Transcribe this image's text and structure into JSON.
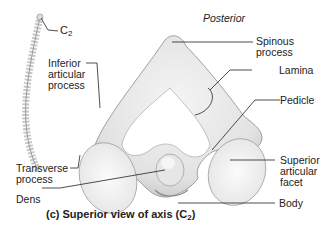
{
  "orientation": {
    "top": "Posterior"
  },
  "spine_label": {
    "text": "C",
    "subscript": "2"
  },
  "labels": {
    "inferior_articular_process": "Inferior\narticular\nprocess",
    "transverse_process": "Transverse\nprocess",
    "dens": "Dens",
    "spinous_process": "Spinous\nprocess",
    "lamina": "Lamina",
    "pedicle": "Pedicle",
    "superior_articular_facet": "Superior\narticular\nfacet",
    "body": "Body"
  },
  "caption": {
    "text": "(c) Superior view of axis (C",
    "subscript": "2",
    "close": ")"
  },
  "colors": {
    "bone_fill": "#ececec",
    "bone_shadow": "#b5b5b5",
    "facet_fill": "#f7f7f7",
    "leader_line": "#222222"
  }
}
